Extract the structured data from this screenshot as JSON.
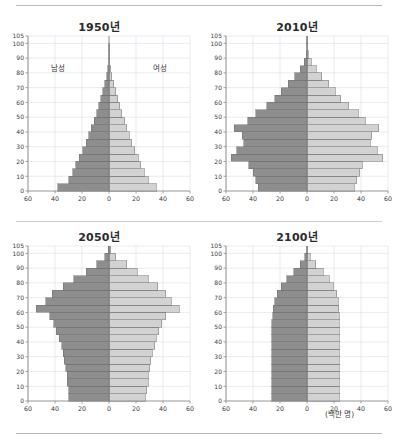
{
  "figure": {
    "unit_label": "(백만 명)",
    "legend": {
      "male_label": "남성",
      "female_label": "여성"
    },
    "axis": {
      "x_ticks": [
        60,
        40,
        20,
        0,
        20,
        40,
        60
      ],
      "x_min": -60,
      "x_max": 60,
      "y_ticks": [
        0,
        10,
        20,
        30,
        40,
        50,
        60,
        70,
        80,
        90,
        100,
        105
      ],
      "y_min": 0,
      "y_max": 105
    },
    "colors": {
      "male_fill": "#8e8e8e",
      "female_fill": "#d2d2d2",
      "bar_stroke": "#6e6e6e",
      "grid": "#d8dde6",
      "axis": "#8a8a8a",
      "text": "#3a3a3a"
    }
  },
  "chart_data": [
    {
      "type": "bar",
      "subtype": "population-pyramid",
      "title": "1950년",
      "xlabel": "",
      "ylabel": "",
      "xlim": [
        -60,
        60
      ],
      "ylim": [
        0,
        105
      ],
      "grid": true,
      "legend": [
        "남성",
        "여성"
      ],
      "legend_position": "inside-upper",
      "age_groups": [
        "0-4",
        "5-9",
        "10-14",
        "15-19",
        "20-24",
        "25-29",
        "30-34",
        "35-39",
        "40-44",
        "45-49",
        "50-54",
        "55-59",
        "60-64",
        "65-69",
        "70-74",
        "75-79",
        "80-84",
        "85-89",
        "90-94",
        "95-99",
        "100-104"
      ],
      "series": [
        {
          "name": "남성",
          "values": [
            38,
            30,
            27,
            24.5,
            22,
            19.5,
            17,
            15,
            13,
            11,
            9,
            7.5,
            6,
            4.5,
            3,
            1.8,
            0.9,
            0.35,
            0.1,
            0.03,
            0.0
          ]
        },
        {
          "name": "여성",
          "values": [
            35,
            29,
            26,
            23.5,
            21.5,
            19,
            17,
            15,
            13,
            11.5,
            9.5,
            8,
            6.5,
            5,
            3.5,
            2.2,
            1.2,
            0.5,
            0.15,
            0.04,
            0.0
          ]
        }
      ]
    },
    {
      "type": "bar",
      "subtype": "population-pyramid",
      "title": "2010년",
      "xlabel": "",
      "ylabel": "",
      "xlim": [
        -60,
        60
      ],
      "ylim": [
        0,
        105
      ],
      "grid": true,
      "legend": [
        "남성",
        "여성"
      ],
      "legend_position": "none",
      "age_groups": [
        "0-4",
        "5-9",
        "10-14",
        "15-19",
        "20-24",
        "25-29",
        "30-34",
        "35-39",
        "40-44",
        "45-49",
        "50-54",
        "55-59",
        "60-64",
        "65-69",
        "70-74",
        "75-79",
        "80-84",
        "85-89",
        "90-94",
        "95-99",
        "100-104"
      ],
      "series": [
        {
          "name": "남성",
          "values": [
            36,
            38,
            40,
            43,
            56,
            52,
            47,
            48,
            54,
            44,
            38,
            30,
            24,
            19,
            14,
            9,
            5,
            2,
            0.6,
            0.12,
            0.02
          ]
        },
        {
          "name": "여성",
          "values": [
            35,
            37,
            39,
            41,
            56,
            52,
            47,
            48,
            53,
            43,
            38,
            31,
            25,
            21,
            16,
            11,
            7,
            3.2,
            1.1,
            0.25,
            0.04
          ]
        }
      ]
    },
    {
      "type": "bar",
      "subtype": "population-pyramid",
      "title": "2050년",
      "xlabel": "",
      "ylabel": "",
      "xlim": [
        -60,
        60
      ],
      "ylim": [
        0,
        105
      ],
      "grid": true,
      "legend": [
        "남성",
        "여성"
      ],
      "legend_position": "none",
      "age_groups": [
        "0-4",
        "5-9",
        "10-14",
        "15-19",
        "20-24",
        "25-29",
        "30-34",
        "35-39",
        "40-44",
        "45-49",
        "50-54",
        "55-59",
        "60-64",
        "65-69",
        "70-74",
        "75-79",
        "80-84",
        "85-89",
        "90-94",
        "95-99",
        "100-104"
      ],
      "series": [
        {
          "name": "남성",
          "values": [
            30,
            30,
            31,
            31,
            32,
            33,
            34,
            35,
            37,
            39,
            41,
            44,
            54,
            47,
            42,
            34,
            26,
            17,
            9,
            3,
            0.6
          ]
        },
        {
          "name": "여성",
          "values": [
            27,
            28,
            29,
            29,
            30,
            31,
            32,
            34,
            35,
            37,
            39,
            42,
            52,
            46,
            42,
            36,
            29,
            21,
            13,
            5,
            1.2
          ]
        }
      ]
    },
    {
      "type": "bar",
      "subtype": "population-pyramid",
      "title": "2100년",
      "xlabel": "(백만 명)",
      "ylabel": "",
      "xlim": [
        -60,
        60
      ],
      "ylim": [
        0,
        105
      ],
      "grid": true,
      "legend": [
        "남성",
        "여성"
      ],
      "legend_position": "none",
      "age_groups": [
        "0-4",
        "5-9",
        "10-14",
        "15-19",
        "20-24",
        "25-29",
        "30-34",
        "35-39",
        "40-44",
        "45-49",
        "50-54",
        "55-59",
        "60-64",
        "65-69",
        "70-74",
        "75-79",
        "80-84",
        "85-89",
        "90-94",
        "95-99",
        "100-104"
      ],
      "series": [
        {
          "name": "남성",
          "values": [
            26,
            26,
            26,
            26,
            26,
            26,
            26,
            26,
            26,
            26,
            26,
            25.5,
            25,
            24,
            22,
            19,
            15,
            10,
            5,
            1.6,
            0.3
          ]
        },
        {
          "name": "여성",
          "values": [
            24,
            24,
            24,
            24,
            24,
            24,
            24,
            24,
            24,
            24,
            24,
            24,
            23.5,
            23,
            22,
            19.5,
            16.5,
            12,
            6.5,
            2.4,
            0.5
          ]
        }
      ]
    }
  ]
}
